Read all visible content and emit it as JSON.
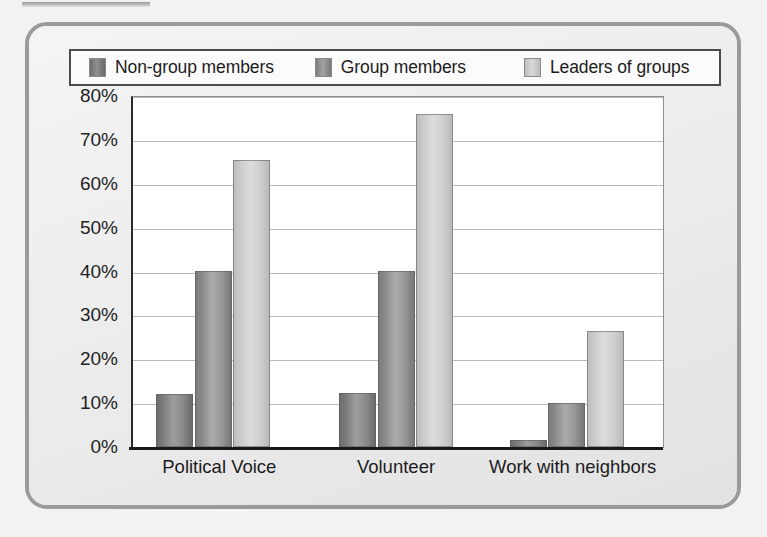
{
  "chart_data": {
    "type": "bar",
    "title": "",
    "subtitle": "",
    "xlabel": "",
    "ylabel": "",
    "categories": [
      "Political Voice",
      "Volunteer",
      "Work with neighbors"
    ],
    "series": [
      {
        "name": "Non-group members",
        "color": "#8a8a8a",
        "values": [
          12,
          12.2,
          1.5
        ]
      },
      {
        "name": "Group members",
        "color": "#9b9b9b",
        "values": [
          40.2,
          40.2,
          10
        ]
      },
      {
        "name": "Leaders of groups",
        "color": "#d2d2d2",
        "values": [
          65.5,
          75.8,
          26.5
        ]
      }
    ],
    "ylim": [
      0,
      80
    ],
    "ytick_step": 10,
    "ytick_labels": [
      "80%",
      "70%",
      "60%",
      "50%",
      "40%",
      "30%",
      "20%",
      "10%",
      "0%"
    ],
    "ytick_values": [
      80,
      70,
      60,
      50,
      40,
      30,
      20,
      10,
      0
    ],
    "grid": true,
    "legend_position": "top",
    "value_suffix": "%"
  },
  "legend": {
    "items": [
      {
        "label": "Non-group members"
      },
      {
        "label": "Group members"
      },
      {
        "label": "Leaders of groups"
      }
    ]
  }
}
